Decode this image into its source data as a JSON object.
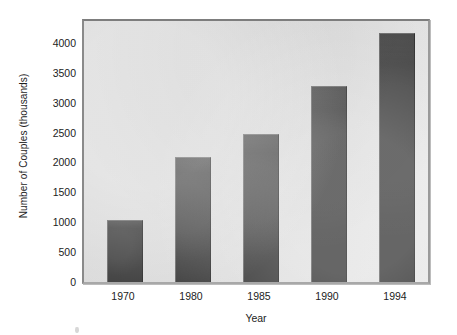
{
  "chart_data": {
    "type": "bar",
    "title": "",
    "xlabel": "Year",
    "ylabel": "Number of Couples (thousands)",
    "categories": [
      "1970",
      "1980",
      "1985",
      "1990",
      "1994"
    ],
    "values": [
      1050,
      2100,
      2500,
      3300,
      4200
    ],
    "ylim": [
      0,
      4400
    ],
    "yticks": [
      0,
      500,
      1000,
      1500,
      2000,
      2500,
      3000,
      3500,
      4000
    ],
    "ytick_labels": [
      "0",
      "500",
      "1000",
      "1500",
      "2000",
      "2500",
      "3000",
      "3500",
      "4000"
    ],
    "grid": false,
    "legend": null,
    "series": [
      {
        "name": "Number of Couples (thousands)",
        "values": [
          1050,
          2100,
          2500,
          3300,
          4200
        ],
        "color": "#3b3b3b"
      }
    ],
    "colors": {
      "bar_fill": "#3b3b3b",
      "plot_background": "#dedede",
      "frame_border": "#8a8a8a",
      "text": "#1c1c1c",
      "page_background": "#ffffff"
    }
  }
}
